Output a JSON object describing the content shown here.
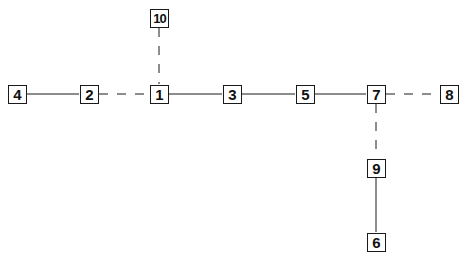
{
  "diagram": {
    "type": "tree-graph",
    "line_color": "#1a1a1a",
    "nodes": [
      {
        "id": "1",
        "label": "1",
        "x": 159,
        "y": 94
      },
      {
        "id": "2",
        "label": "2",
        "x": 89,
        "y": 94
      },
      {
        "id": "3",
        "label": "3",
        "x": 232,
        "y": 94
      },
      {
        "id": "4",
        "label": "4",
        "x": 17,
        "y": 94
      },
      {
        "id": "5",
        "label": "5",
        "x": 305,
        "y": 94
      },
      {
        "id": "6",
        "label": "6",
        "x": 376,
        "y": 242
      },
      {
        "id": "7",
        "label": "7",
        "x": 376,
        "y": 94
      },
      {
        "id": "8",
        "label": "8",
        "x": 449,
        "y": 94
      },
      {
        "id": "9",
        "label": "9",
        "x": 376,
        "y": 168
      },
      {
        "id": "10",
        "label": "10",
        "x": 159,
        "y": 18
      }
    ],
    "edges": [
      {
        "from": "4",
        "to": "2",
        "style": "solid"
      },
      {
        "from": "2",
        "to": "1",
        "style": "dashed"
      },
      {
        "from": "1",
        "to": "10",
        "style": "dashed"
      },
      {
        "from": "1",
        "to": "3",
        "style": "solid"
      },
      {
        "from": "3",
        "to": "5",
        "style": "solid"
      },
      {
        "from": "5",
        "to": "7",
        "style": "solid"
      },
      {
        "from": "7",
        "to": "8",
        "style": "dashed"
      },
      {
        "from": "7",
        "to": "9",
        "style": "dashed"
      },
      {
        "from": "9",
        "to": "6",
        "style": "solid"
      }
    ]
  }
}
